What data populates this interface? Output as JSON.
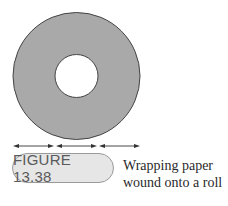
{
  "figure": {
    "label": "FIGURE 13.38",
    "caption_lines": [
      "Wrapping paper",
      "wound onto a roll"
    ]
  },
  "diagram": {
    "outer_circle": {
      "cx": 76.5,
      "cy": 76,
      "r": 63.5,
      "fill": "#a9a9a9",
      "stroke": "#444444"
    },
    "inner_circle": {
      "cx": 76.5,
      "cy": 76,
      "r": 21.5,
      "fill": "#ffffff",
      "stroke": "#444444"
    },
    "dimension_arrows": [
      {
        "x1": 13,
        "x2": 54,
        "y": 146
      },
      {
        "x1": 56,
        "x2": 97,
        "y": 146
      },
      {
        "x1": 99,
        "x2": 140,
        "y": 146
      }
    ],
    "colors": {
      "ring": "#a9a9a9",
      "pill_fill": "#e6e6e6",
      "pill_border": "#9a9a9a",
      "label_text": "#5a5a5a",
      "arrow": "#333333"
    }
  }
}
